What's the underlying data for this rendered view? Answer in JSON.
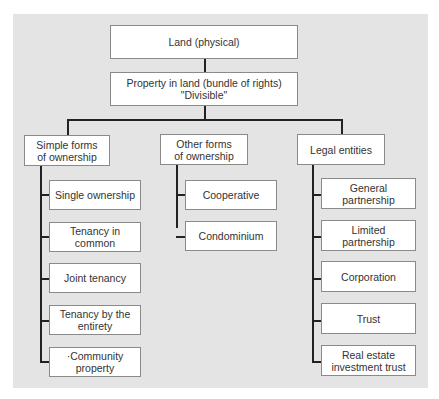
{
  "diagram": {
    "root": "Land (physical)",
    "level2": "Property in land (bundle of rights)\n\"Divisible\"",
    "categories": [
      {
        "label": "Simple forms\nof ownership",
        "children": [
          "Single ownership",
          "Tenancy in\ncommon",
          "Joint tenancy",
          "Tenancy by the\nentirety",
          "·Community\nproperty"
        ]
      },
      {
        "label": "Other forms\nof ownership",
        "children": [
          "Cooperative",
          "Condominium"
        ]
      },
      {
        "label": "Legal entities",
        "children": [
          "General\npartnership",
          "Limited\npartnership",
          "Corporation",
          "Trust",
          "Real estate\ninvestment trust"
        ]
      }
    ]
  }
}
